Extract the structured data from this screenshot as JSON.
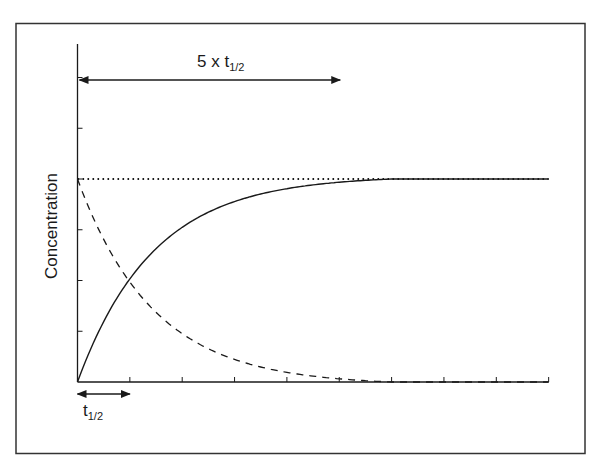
{
  "chart_data": {
    "type": "line",
    "title": "",
    "xlabel": "",
    "ylabel": "Concentration",
    "x_unit": "half-lives (t1/2)",
    "x": [
      0,
      1,
      2,
      3,
      4,
      5,
      6,
      7,
      8,
      9
    ],
    "x_ticks": 10,
    "y_ticks": 7,
    "xlim": [
      0,
      9
    ],
    "ylim": [
      0,
      1.0
    ],
    "steady_state_level": 1.0,
    "grid": false,
    "legend": null,
    "series": [
      {
        "name": "accumulation (rising to steady state)",
        "style": "solid",
        "values": [
          0,
          0.5,
          0.75,
          0.875,
          0.9375,
          0.969,
          1.0,
          1.0,
          1.0,
          1.0
        ]
      },
      {
        "name": "elimination (exponential decay)",
        "style": "dashed",
        "values": [
          1.0,
          0.5,
          0.25,
          0.125,
          0.0625,
          0.031,
          0.0,
          0.0,
          0.0,
          0.0
        ]
      },
      {
        "name": "steady-state concentration",
        "style": "dotted",
        "values": [
          1,
          1,
          1,
          1,
          1,
          1,
          1,
          1,
          1,
          1
        ]
      }
    ],
    "annotations": [
      {
        "text": "5 x t1/2",
        "type": "double-arrow",
        "from_x": 0,
        "to_x": 5
      },
      {
        "text": "t1/2",
        "type": "double-arrow",
        "from_x": 0,
        "to_x": 1
      }
    ]
  },
  "labels": {
    "y_axis": "Concentration",
    "top_arrow_main": "5 x t",
    "top_arrow_sub": "1/2",
    "bottom_arrow_main": "t",
    "bottom_arrow_sub": "1/2"
  },
  "colors": {
    "line": "#1a1a1a",
    "frame": "#333333",
    "background": "#ffffff"
  }
}
